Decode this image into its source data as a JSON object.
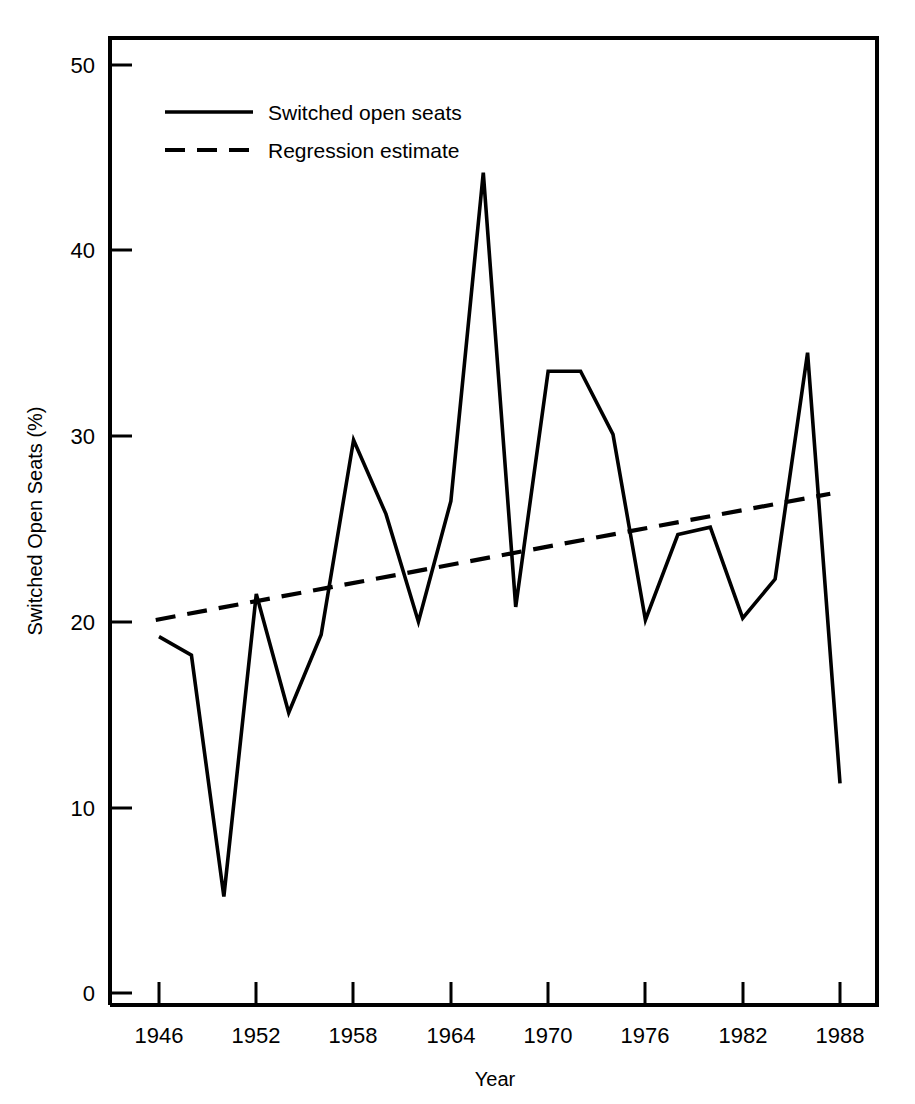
{
  "chart_data": {
    "type": "line",
    "title": "",
    "xlabel": "Year",
    "ylabel": "Switched Open Seats (%)",
    "xlim": [
      1944,
      1990
    ],
    "ylim": [
      0,
      51
    ],
    "grid": false,
    "legend_position": "upper-left-inside",
    "x": [
      1946,
      1948,
      1950,
      1952,
      1954,
      1956,
      1958,
      1960,
      1962,
      1964,
      1966,
      1968,
      1970,
      1972,
      1974,
      1976,
      1978,
      1980,
      1982,
      1984,
      1986,
      1988
    ],
    "xticks": [
      1946,
      1952,
      1958,
      1964,
      1970,
      1976,
      1982,
      1988
    ],
    "xtick_labels": [
      "1946",
      "1952",
      "1958",
      "1964",
      "1970",
      "1976",
      "1982",
      "1988"
    ],
    "yticks": [
      0,
      10,
      20,
      30,
      40,
      50
    ],
    "ytick_labels": [
      "0",
      "10",
      "20",
      "30",
      "40",
      "50"
    ],
    "series": [
      {
        "name": "Switched open seats",
        "style": "solid",
        "color": "#000000",
        "values": [
          19.2,
          18.2,
          5.2,
          21.5,
          15.1,
          19.3,
          29.8,
          25.8,
          20.0,
          26.5,
          44.2,
          20.8,
          33.5,
          33.5,
          30.1,
          20.1,
          24.7,
          25.1,
          20.2,
          22.3,
          34.5,
          11.3
        ]
      },
      {
        "name": "Regression estimate",
        "style": "dashed",
        "color": "#000000",
        "x_endpoints": [
          1945.8,
          1987.4
        ],
        "y_endpoints": [
          20.1,
          26.9
        ],
        "values": [
          20.2,
          20.5,
          20.9,
          21.2,
          21.5,
          21.8,
          22.1,
          22.5,
          22.8,
          23.1,
          23.4,
          23.8,
          24.1,
          24.4,
          24.7,
          25.0,
          25.4,
          25.7,
          26.0,
          26.3,
          26.7,
          27.0
        ]
      }
    ]
  },
  "legend": {
    "items": [
      {
        "label": "Switched open seats",
        "style": "solid"
      },
      {
        "label": "Regression estimate",
        "style": "dashed"
      }
    ]
  },
  "axes": {
    "x_title": "Year",
    "y_title": "Switched Open Seats (%)"
  }
}
